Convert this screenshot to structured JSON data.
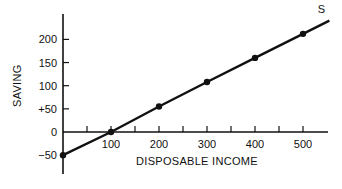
{
  "chart_data": {
    "type": "line",
    "title": "",
    "xlabel": "DISPOSABLE INCOME",
    "ylabel": "SAVING",
    "series": [
      {
        "name": "S",
        "x": [
          0,
          100,
          200,
          300,
          400,
          500
        ],
        "values": [
          -50,
          0,
          55,
          108,
          160,
          212
        ]
      }
    ],
    "x_ticks": [
      100,
      200,
      300,
      400,
      500
    ],
    "x_tick_labels": [
      "100",
      "200",
      "300",
      "400",
      "500"
    ],
    "y_ticks": [
      -50,
      0,
      50,
      100,
      150,
      200
    ],
    "y_tick_labels": [
      "−50",
      "0",
      "+50",
      "100",
      "150",
      "200"
    ],
    "xlim": [
      0,
      550
    ],
    "ylim": [
      -75,
      250
    ],
    "grid": false,
    "legend": "none",
    "annotations": [
      {
        "text": "S",
        "x": 505,
        "y": 240
      }
    ],
    "colors": {
      "line": "#111111",
      "axis": "#111111"
    }
  }
}
